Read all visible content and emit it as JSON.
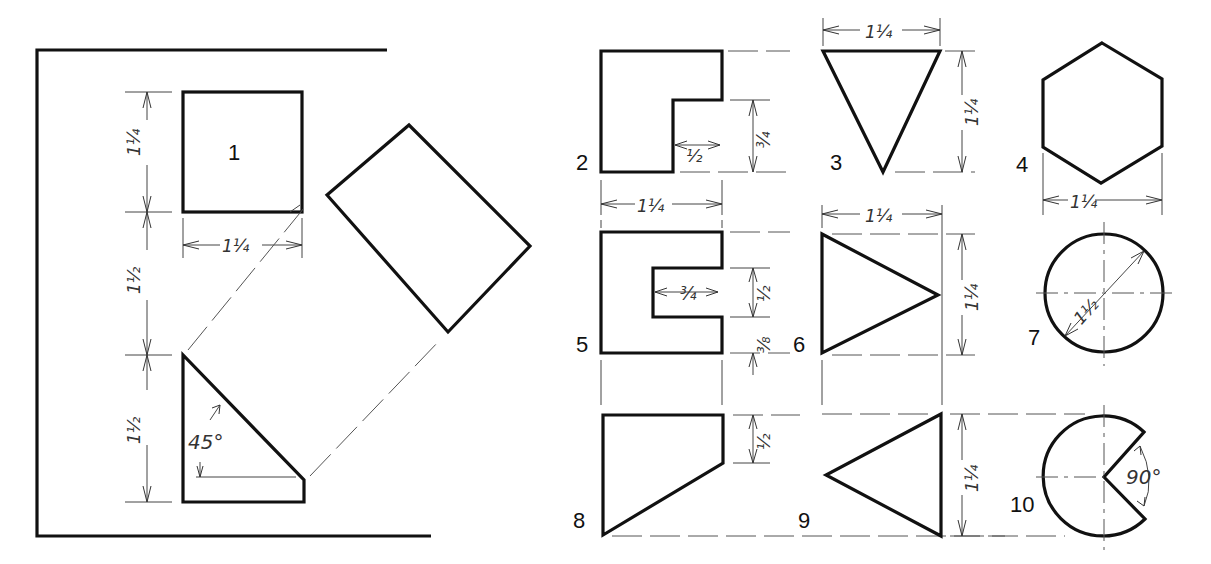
{
  "figures": [
    {
      "id": "1",
      "label": "1",
      "shape": "square with auxiliary view",
      "dims": {
        "height": "1 1/4",
        "width": "1 1/4",
        "gap": "1 1/2",
        "triangle_height": "1 1/2",
        "angle": "45°"
      }
    },
    {
      "id": "2",
      "label": "2",
      "shape": "L-shape",
      "dims": {
        "width": "1 1/4",
        "notch_width": "1/2",
        "notch_height": "3/4"
      }
    },
    {
      "id": "3",
      "label": "3",
      "shape": "inverted triangle",
      "dims": {
        "width": "1 1/4",
        "height": "1 1/4"
      }
    },
    {
      "id": "4",
      "label": "4",
      "shape": "hexagon",
      "dims": {
        "width": "1 1/4"
      }
    },
    {
      "id": "5",
      "label": "5",
      "shape": "C-shape",
      "dims": {
        "slot_depth": "3/4",
        "slot_height": "1/2",
        "bottom": "3/8"
      }
    },
    {
      "id": "6",
      "label": "6",
      "shape": "right-pointing triangle",
      "dims": {
        "width": "1 1/4",
        "height": "1 1/4"
      }
    },
    {
      "id": "7",
      "label": "7",
      "shape": "circle",
      "dims": {
        "diameter": "1 1/2"
      }
    },
    {
      "id": "8",
      "label": "8",
      "shape": "trapezoid",
      "dims": {
        "side": "1/2"
      }
    },
    {
      "id": "9",
      "label": "9",
      "shape": "left-pointing triangle",
      "dims": {
        "height": "1 1/4"
      }
    },
    {
      "id": "10",
      "label": "10",
      "shape": "circle with 90° notch",
      "dims": {
        "angle": "90°"
      }
    }
  ],
  "labels": {
    "fig1": "1",
    "fig2": "2",
    "fig3": "3",
    "fig4": "4",
    "fig5": "5",
    "fig6": "6",
    "fig7": "7",
    "fig8": "8",
    "fig9": "9",
    "fig10": "10",
    "angle45": "45°",
    "angle90": "90°"
  },
  "dims": {
    "whole1": "1",
    "frac_1_4_num": "1",
    "frac_1_4_den": "4",
    "frac_1_2_num": "1",
    "frac_1_2_den": "2",
    "frac_3_4_num": "3",
    "frac_3_4_den": "4",
    "frac_3_8_num": "3",
    "frac_3_8_den": "8"
  },
  "colors": {
    "line": "#111111",
    "thin": "#444444",
    "background": "#ffffff"
  }
}
